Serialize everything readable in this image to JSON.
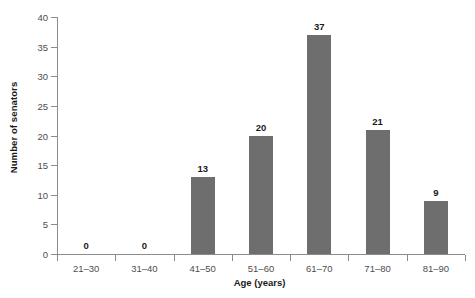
{
  "chart_data": {
    "type": "bar",
    "title": "",
    "subtitle": "",
    "xlabel": "Age (years)",
    "ylabel": "Number of senators",
    "categories": [
      "21–30",
      "31–40",
      "41–50",
      "51–60",
      "61–70",
      "71–80",
      "81–90"
    ],
    "values": [
      0,
      0,
      13,
      20,
      37,
      21,
      9
    ],
    "value_labels": [
      "0",
      "0",
      "13",
      "20",
      "37",
      "21",
      "9"
    ],
    "ylim": [
      0,
      40
    ],
    "ytick_values": [
      0,
      5,
      10,
      15,
      20,
      25,
      30,
      35,
      40
    ],
    "ytick_labels": [
      "0",
      "5",
      "10",
      "15",
      "20",
      "25",
      "30",
      "35",
      "40"
    ],
    "grid": false,
    "legend": false,
    "legend_position": "none",
    "bar_color": "#6e6e6e",
    "axis_color": "#8c8c8c",
    "text_color": "#1a1a1a",
    "tick_label_color": "#4d4d4d",
    "background": "#ffffff",
    "data_labels_shown": true
  }
}
